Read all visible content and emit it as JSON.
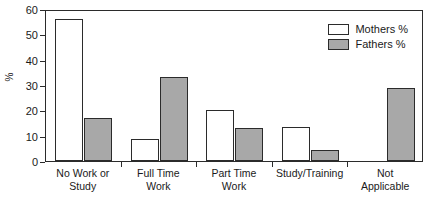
{
  "chart_data": {
    "type": "bar",
    "title": "",
    "subtitle": "",
    "xlabel": "",
    "ylabel": "%",
    "ylim": [
      0,
      60
    ],
    "yticks": [
      0,
      10,
      20,
      30,
      40,
      50,
      60
    ],
    "grid": false,
    "legend_position": "top-right inside plot",
    "categories": [
      "No Work or Study",
      "Full Time Work",
      "Part Time Work",
      "Study/Training",
      "Not Applicable"
    ],
    "category_lines": [
      [
        "No Work or",
        "Study"
      ],
      [
        "Full Time",
        "Work"
      ],
      [
        "Part Time",
        "Work"
      ],
      [
        "Study/Training",
        ""
      ],
      [
        "Not",
        "Applicable"
      ]
    ],
    "series": [
      {
        "name": "Mothers %",
        "color": "#ffffff",
        "values": [
          56,
          8.5,
          20,
          13.5,
          0
        ]
      },
      {
        "name": "Fathers %",
        "color": "#a8a8a8",
        "values": [
          17,
          33,
          13,
          4.5,
          29
        ]
      }
    ]
  },
  "legend": {
    "items": [
      {
        "label": "Mothers %",
        "swatch": "mothers"
      },
      {
        "label": "Fathers %",
        "swatch": "fathers"
      }
    ]
  },
  "axes": {
    "y_title": "%",
    "y_tick_labels": [
      "60",
      "50",
      "40",
      "30",
      "20",
      "10",
      "0"
    ]
  },
  "colors": {
    "mothers_fill": "#ffffff",
    "fathers_fill": "#a8a8a8",
    "outline": "#2b2b2b",
    "background": "#ffffff"
  }
}
